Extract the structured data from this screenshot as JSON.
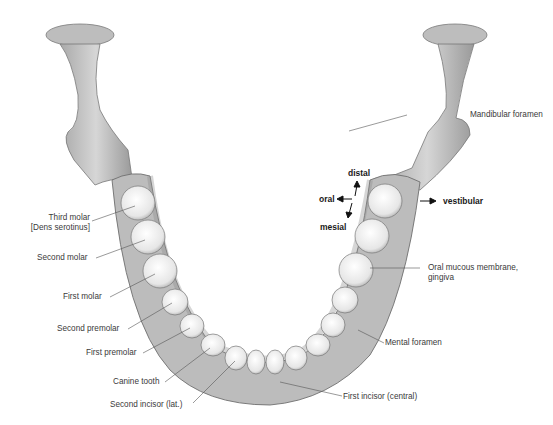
{
  "figure": {
    "colors": {
      "background": "#ffffff",
      "bone": "#c9c9c9",
      "bone_shadow": "#8e8e8e",
      "tooth": "#f2f2f2",
      "leader": "#555555",
      "text": "#3a3a3a"
    }
  },
  "labels": {
    "left": [
      {
        "id": "third-molar",
        "line1": "Third molar",
        "line2": "[Dens serotinus]"
      },
      {
        "id": "second-molar",
        "line1": "Second molar"
      },
      {
        "id": "first-molar",
        "line1": "First molar"
      },
      {
        "id": "second-premolar",
        "line1": "Second premolar"
      },
      {
        "id": "first-premolar",
        "line1": "First premolar"
      },
      {
        "id": "canine",
        "line1": "Canine tooth"
      },
      {
        "id": "second-incisor",
        "line1": "Second incisor (lat.)"
      }
    ],
    "right": [
      {
        "id": "mandibular-foramen",
        "line1": "Mandibular foramen"
      },
      {
        "id": "oral-mucous",
        "line1": "Oral mucous membrane,",
        "line2": "gingiva"
      },
      {
        "id": "mental-foramen",
        "line1": "Mental foramen"
      },
      {
        "id": "first-incisor",
        "line1": "First incisor (central)"
      }
    ]
  },
  "directions": {
    "distal": "distal",
    "oral": "oral",
    "mesial": "mesial",
    "vestibular": "vestibular"
  }
}
